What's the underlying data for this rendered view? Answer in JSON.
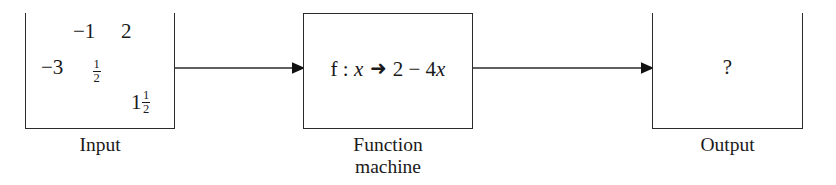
{
  "diagram": {
    "title_semantic": "function-machine-diagram",
    "stroke_color": "#2b2b2b",
    "background_color": "#ffffff",
    "input": {
      "caption": "Input",
      "values": [
        {
          "name": "negative-one",
          "text": "−1"
        },
        {
          "name": "two",
          "text": "2"
        },
        {
          "name": "negative-three",
          "text": "−3"
        },
        {
          "name": "one-half",
          "whole": "",
          "numerator": "1",
          "denominator": "2"
        },
        {
          "name": "one-and-one-half",
          "whole": "1",
          "numerator": "1",
          "denominator": "2"
        }
      ]
    },
    "machine": {
      "caption": "Function\nmachine",
      "expression": {
        "function_name": "f",
        "colon": ":",
        "variable": "x",
        "arrow": "➜",
        "rule": "2 − 4",
        "rule_variable": "x",
        "full_text": "f : x ➜ 2 − 4x"
      }
    },
    "output": {
      "caption": "Output",
      "value": "?"
    },
    "arrows": [
      {
        "name": "input-to-machine",
        "direction": "right"
      },
      {
        "name": "machine-to-output",
        "direction": "right"
      }
    ]
  }
}
